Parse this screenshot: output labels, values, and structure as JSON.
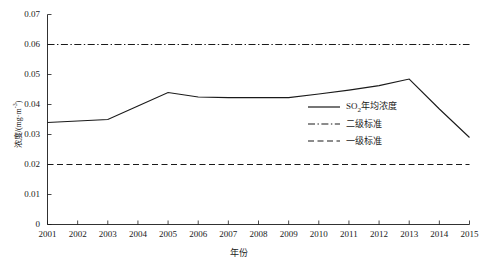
{
  "chart_data": {
    "type": "line",
    "title": "",
    "xlabel": "年份",
    "ylabel": "浓度/(mg·m⁻³)",
    "x": [
      2001,
      2002,
      2003,
      2004,
      2005,
      2006,
      2007,
      2008,
      2009,
      2010,
      2011,
      2012,
      2013,
      2014,
      2015
    ],
    "xlim": [
      2001,
      2015
    ],
    "ylim": [
      0,
      0.07
    ],
    "grid": false,
    "legend_position": "center-right-inside",
    "xticklabels": [
      "2001",
      "2002",
      "2003",
      "2004",
      "2005",
      "2006",
      "2007",
      "2008",
      "2009",
      "2010",
      "2011",
      "2012",
      "2013",
      "2014",
      "2015"
    ],
    "yticks": [
      0,
      0.01,
      0.02,
      0.03,
      0.04,
      0.05,
      0.06,
      0.07
    ],
    "yticklabels": [
      "0",
      "0.01",
      "0.02",
      "0.03",
      "0.04",
      "0.05",
      "0.06",
      "0.07"
    ],
    "series": [
      {
        "name": "SO2年均浓度",
        "style": "solid",
        "color": "#1a1a1a",
        "values": [
          0.034,
          0.0345,
          0.035,
          0.0395,
          0.044,
          0.0425,
          0.0423,
          0.0423,
          0.0423,
          0.0435,
          0.0448,
          0.0463,
          0.0485,
          0.0385,
          0.029
        ]
      },
      {
        "name": "二级标准",
        "style": "dashdot",
        "color": "#1a1a1a",
        "constant": 0.06
      },
      {
        "name": "一级标准",
        "style": "dashed",
        "color": "#1a1a1a",
        "constant": 0.02
      }
    ]
  },
  "legend": {
    "entries": [
      {
        "label_prefix": "SO",
        "label_sub": "2",
        "label_rest": "年均浓度",
        "style": "solid"
      },
      {
        "label_prefix": "二级标准",
        "label_sub": "",
        "label_rest": "",
        "style": "dashdot"
      },
      {
        "label_prefix": "一级标准",
        "label_sub": "",
        "label_rest": "",
        "style": "dashed"
      }
    ]
  },
  "axis_titles": {
    "y_prefix": "浓度/(mg·m",
    "y_sup": "-3",
    "y_suffix": ")",
    "x": "年份"
  }
}
